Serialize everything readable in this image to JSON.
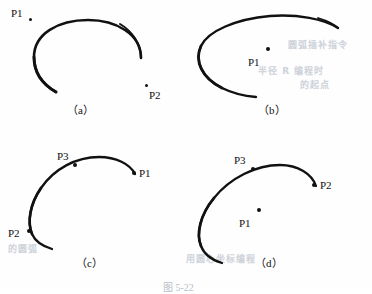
{
  "figure": {
    "caption": "图 5-22",
    "background_color": "#fefefe",
    "stroke_color": "#111111",
    "bleed_text_color": "#c6ccd4"
  },
  "panels": [
    {
      "id": "a",
      "caption": "（a）",
      "description": "open C-shaped arc with two labelled points outside the arc",
      "points": [
        {
          "label": "P1",
          "on_curve": false,
          "x": 30,
          "y": 19
        },
        {
          "label": "P2",
          "on_curve": false,
          "x": 146,
          "y": 85
        }
      ]
    },
    {
      "id": "b",
      "caption": "（b）",
      "description": "flat wide elliptical C-shaped arc with one labelled point inside",
      "points": [
        {
          "label": "P1",
          "on_curve": false,
          "x": 268,
          "y": 51
        }
      ]
    },
    {
      "id": "c",
      "caption": "（c）",
      "description": "arc with start point P1 at right end, P2 at left on curve and P3 on curve",
      "points": [
        {
          "label": "P1",
          "on_curve": true,
          "x": 134,
          "y": 173
        },
        {
          "label": "P2",
          "on_curve": true,
          "x": 30,
          "y": 231
        },
        {
          "label": "P3",
          "on_curve": true,
          "x": 76,
          "y": 166
        }
      ]
    },
    {
      "id": "d",
      "caption": "（d）",
      "description": "arc with P2 at right end on curve, P3 on curve and P1 floating inside",
      "points": [
        {
          "label": "P2",
          "on_curve": true,
          "x": 314,
          "y": 186
        },
        {
          "label": "P3",
          "on_curve": true,
          "x": 253,
          "y": 170
        },
        {
          "label": "P1",
          "on_curve": false,
          "x": 259,
          "y": 213
        }
      ]
    }
  ],
  "bleed_texts": [
    {
      "text": "圆弧插补指令",
      "x": 288,
      "y": 44
    },
    {
      "text": "半径 R 编程时",
      "x": 262,
      "y": 70
    },
    {
      "text": "的起点",
      "x": 300,
      "y": 84
    },
    {
      "text": "用圆心坐标编程",
      "x": 188,
      "y": 258
    },
    {
      "text": "的圆弧",
      "x": 10,
      "y": 248
    }
  ]
}
